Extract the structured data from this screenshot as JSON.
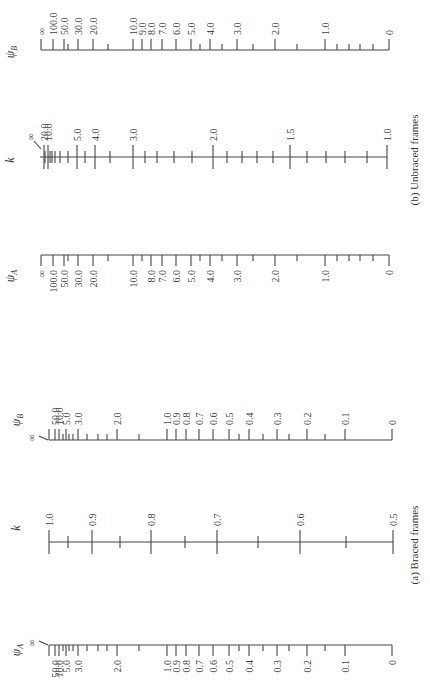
{
  "chart_data": [
    {
      "type": "nomograph",
      "title": "(b) Unbraced frames",
      "caption": "(b) Unbraced frames",
      "orientation": "rotated -90deg (text reads bottom-to-top)",
      "axes": [
        {
          "name": "psi_B",
          "label": "ψB",
          "screen_y": 50,
          "tick_dir": "up",
          "major": [
            {
              "label": "∞",
              "x": 41
            },
            {
              "label": "100.0",
              "x": 53
            },
            {
              "label": "50.0",
              "x": 64
            },
            {
              "label": "30.0",
              "x": 78
            },
            {
              "label": "20.0",
              "x": 93
            },
            {
              "label": "10.0",
              "x": 133
            },
            {
              "label": "9.0",
              "x": 142
            },
            {
              "label": "8.0",
              "x": 151
            },
            {
              "label": "7.0",
              "x": 162
            },
            {
              "label": "6.0",
              "x": 176
            },
            {
              "label": "5.0",
              "x": 191
            },
            {
              "label": "4.0",
              "x": 210
            },
            {
              "label": "3.0",
              "x": 237
            },
            {
              "label": "2.0",
              "x": 275
            },
            {
              "label": "1.0",
              "x": 325
            },
            {
              "label": "0",
              "x": 389
            }
          ],
          "minor_x": [
            68,
            108,
            200,
            222,
            253,
            297,
            337,
            349,
            360,
            373
          ]
        },
        {
          "name": "k",
          "label": "k",
          "screen_y": 157,
          "tick_dir": "both",
          "major": [
            {
              "label": "∞",
              "x": 40
            },
            {
              "label": "20.0",
              "x": 44
            },
            {
              "label": "10.0",
              "x": 48
            },
            {
              "label": "5.0",
              "x": 77
            },
            {
              "label": "4.0",
              "x": 95
            },
            {
              "label": "3.0",
              "x": 133
            },
            {
              "label": "2.0",
              "x": 213
            },
            {
              "label": "1.5",
              "x": 290
            },
            {
              "label": "1.0",
              "x": 387
            }
          ],
          "minor_x": [
            45,
            50,
            52,
            55,
            60,
            68,
            85,
            110,
            145,
            157,
            174,
            192,
            227,
            242,
            257,
            273,
            307,
            326,
            345,
            367
          ]
        },
        {
          "name": "psi_A",
          "label": "ψA",
          "screen_y": 255,
          "tick_dir": "down",
          "major": [
            {
              "label": "∞",
              "x": 41
            },
            {
              "label": "100.0",
              "x": 53
            },
            {
              "label": "50.0",
              "x": 64
            },
            {
              "label": "30.0",
              "x": 78
            },
            {
              "label": "20.0",
              "x": 93
            },
            {
              "label": "10.0",
              "x": 133
            },
            {
              "label": "8.0",
              "x": 151
            },
            {
              "label": "7.0",
              "x": 162
            },
            {
              "label": "6.0",
              "x": 176
            },
            {
              "label": "5.0",
              "x": 191
            },
            {
              "label": "4.0",
              "x": 210
            },
            {
              "label": "3.0",
              "x": 237
            },
            {
              "label": "2.0",
              "x": 275
            },
            {
              "label": "1.0",
              "x": 325
            },
            {
              "label": "0",
              "x": 389
            }
          ],
          "minor_x": [
            68,
            108,
            142,
            200,
            222,
            253,
            297,
            337,
            349,
            360,
            373
          ]
        }
      ]
    },
    {
      "type": "nomograph",
      "title": "(a) Braced frames",
      "caption": "(a) Braced frames",
      "orientation": "rotated -90deg (text reads bottom-to-top)",
      "axes": [
        {
          "name": "psi_B",
          "label": "ψB",
          "screen_y": 440,
          "tick_dir": "up",
          "major": [
            {
              "label": "∞",
              "x": 49
            },
            {
              "label": "50.0",
              "x": 55
            },
            {
              "label": "10.0",
              "x": 59
            },
            {
              "label": "5.0",
              "x": 66
            },
            {
              "label": "3.0",
              "x": 78
            },
            {
              "label": "2.0",
              "x": 117
            },
            {
              "label": "1.0",
              "x": 167
            },
            {
              "label": "0.9",
              "x": 176
            },
            {
              "label": "0.8",
              "x": 186
            },
            {
              "label": "0.7",
              "x": 199
            },
            {
              "label": "0.6",
              "x": 213
            },
            {
              "label": "0.5",
              "x": 229
            },
            {
              "label": "0.4",
              "x": 249
            },
            {
              "label": "0.3",
              "x": 277
            },
            {
              "label": "0.2",
              "x": 307
            },
            {
              "label": "0.1",
              "x": 345
            },
            {
              "label": "0",
              "x": 392
            }
          ],
          "minor_x": [
            63,
            69,
            73,
            87,
            98,
            107,
            139,
            239,
            263,
            289,
            325
          ]
        },
        {
          "name": "k",
          "label": "k",
          "screen_y": 542,
          "tick_dir": "both",
          "major": [
            {
              "label": "1.0",
              "x": 49
            },
            {
              "label": "0.9",
              "x": 92
            },
            {
              "label": "0.8",
              "x": 151
            },
            {
              "label": "0.7",
              "x": 217
            },
            {
              "label": "0.6",
              "x": 300
            },
            {
              "label": "0.5",
              "x": 393
            }
          ],
          "minor_x": [
            68,
            120,
            185,
            258,
            346
          ]
        },
        {
          "name": "psi_A",
          "label": "ψA",
          "screen_y": 645,
          "tick_dir": "down",
          "major": [
            {
              "label": "∞",
              "x": 49
            },
            {
              "label": "50.0",
              "x": 55
            },
            {
              "label": "10.0",
              "x": 59
            },
            {
              "label": "5.0",
              "x": 66
            },
            {
              "label": "3.0",
              "x": 78
            },
            {
              "label": "2.0",
              "x": 117
            },
            {
              "label": "1.0",
              "x": 167
            },
            {
              "label": "0.9",
              "x": 176
            },
            {
              "label": "0.8",
              "x": 186
            },
            {
              "label": "0.7",
              "x": 199
            },
            {
              "label": "0.6",
              "x": 213
            },
            {
              "label": "0.5",
              "x": 229
            },
            {
              "label": "0.4",
              "x": 249
            },
            {
              "label": "0.3",
              "x": 277
            },
            {
              "label": "0.2",
              "x": 307
            },
            {
              "label": "0.1",
              "x": 345
            },
            {
              "label": "0",
              "x": 392
            }
          ],
          "minor_x": [
            63,
            69,
            73,
            87,
            98,
            107,
            139,
            239,
            263,
            289,
            325
          ]
        }
      ]
    }
  ],
  "captions": {
    "unbraced": "(b) Unbraced frames",
    "braced": "(a) Braced frames"
  },
  "axis_titles": {
    "psi_b": "ψ",
    "psi_b_sub": "B",
    "psi_a": "ψ",
    "psi_a_sub": "A",
    "k": "k"
  },
  "colors": {
    "ink": "#444444",
    "background": "#ffffff"
  }
}
